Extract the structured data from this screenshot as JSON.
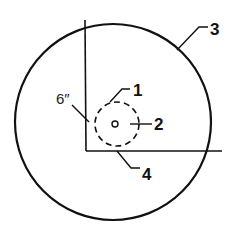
{
  "diagram": {
    "labels": {
      "l1": "1",
      "l2": "2",
      "l3": "3",
      "l4": "4",
      "dimension": "6″"
    },
    "colors": {
      "stroke": "#111111",
      "background": "#ffffff"
    }
  }
}
